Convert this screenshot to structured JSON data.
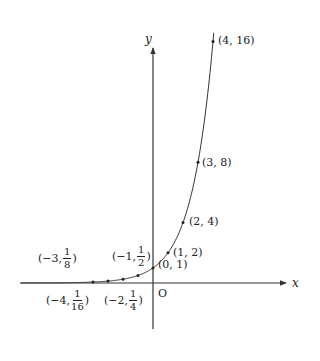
{
  "chart_data": {
    "type": "line",
    "title": "",
    "function": "y = 2^x",
    "xlabel": "x",
    "ylabel": "y",
    "origin_label": "O",
    "points": [
      {
        "x": -4,
        "y": 0.0625,
        "label_pre": "(−4,",
        "num": "1",
        "den": "16",
        "label_post": ")"
      },
      {
        "x": -3,
        "y": 0.125,
        "label_pre": "(−3,",
        "num": "1",
        "den": "8",
        "label_post": ")"
      },
      {
        "x": -2,
        "y": 0.25,
        "label_pre": "(−2,",
        "num": "1",
        "den": "4",
        "label_post": ")"
      },
      {
        "x": -1,
        "y": 0.5,
        "label_pre": "(−1,",
        "num": "1",
        "den": "2",
        "label_post": ")"
      },
      {
        "x": 0,
        "y": 1,
        "label": "(0, 1)"
      },
      {
        "x": 1,
        "y": 2,
        "label": "(1, 2)"
      },
      {
        "x": 2,
        "y": 4,
        "label": "(2, 4)"
      },
      {
        "x": 3,
        "y": 8,
        "label": "(3, 8)"
      },
      {
        "x": 4,
        "y": 16,
        "label": "(4, 16)"
      }
    ],
    "grid": false,
    "legend": null,
    "colors": {
      "axis": "#333333",
      "curve": "#333333",
      "text": "#222222"
    }
  }
}
